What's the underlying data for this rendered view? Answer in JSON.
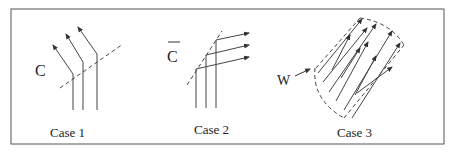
{
  "figure": {
    "panels": [
      {
        "id": "case1",
        "caption": "Case 1",
        "label": "C"
      },
      {
        "id": "case2",
        "caption": "Case 2",
        "label": "C",
        "label_overbar": true
      },
      {
        "id": "case3",
        "caption": "Case 3",
        "label": "W"
      }
    ]
  }
}
